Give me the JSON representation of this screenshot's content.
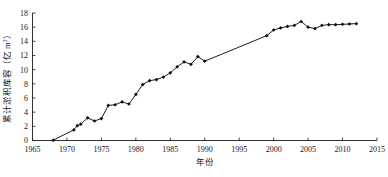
{
  "chart_data": {
    "type": "line",
    "title": "",
    "xlabel": "年份",
    "ylabel": "累计淤积库容（亿 m³）",
    "ylabel_main": "累计淤积库容（亿 m",
    "ylabel_sup": "3",
    "ylabel_tail": "）",
    "xlim": [
      1965,
      2015
    ],
    "ylim": [
      0,
      18
    ],
    "xticks": [
      1965,
      1970,
      1975,
      1980,
      1985,
      1990,
      1995,
      2000,
      2005,
      2010,
      2015
    ],
    "yticks": [
      0,
      2,
      4,
      6,
      8,
      10,
      12,
      14,
      16,
      18
    ],
    "xtick_labels": [
      "1965",
      "1970",
      "1975",
      "1980",
      "1985",
      "1990",
      "1995",
      "2000",
      "2005",
      "2010",
      "2015"
    ],
    "ytick_labels": [
      "0",
      "2",
      "4",
      "6",
      "8",
      "10",
      "12",
      "14",
      "16",
      "18"
    ],
    "grid": false,
    "legend": false,
    "legend_position": "none",
    "marker": "diamond",
    "marker_color": "#0d0d0d",
    "line_color": "#111111",
    "background": "#ffffff",
    "series": [
      {
        "name": "累计淤积库容",
        "x": [
          1968,
          1971,
          1971.5,
          1972,
          1973,
          1974,
          1975,
          1976,
          1977,
          1978,
          1979,
          1980,
          1981,
          1982,
          1983,
          1984,
          1985,
          1986,
          1987,
          1988,
          1989,
          1990,
          1999,
          2000,
          2001,
          2002,
          2003,
          2004,
          2005,
          2006,
          2007,
          2008,
          2009,
          2010,
          2011,
          2012
        ],
        "values": [
          0.05,
          1.5,
          2.1,
          2.3,
          3.2,
          2.75,
          3.1,
          4.95,
          5.05,
          5.45,
          5.15,
          6.5,
          7.9,
          8.45,
          8.6,
          8.95,
          9.55,
          10.4,
          11.1,
          10.75,
          11.85,
          11.2,
          14.8,
          15.6,
          15.9,
          16.1,
          16.25,
          16.8,
          16.0,
          15.8,
          16.25,
          16.35,
          16.35,
          16.4,
          16.45,
          16.5
        ]
      }
    ]
  },
  "axes": {
    "x_axis_name": "year-axis",
    "y_axis_name": "cumulative-storage-axis"
  }
}
